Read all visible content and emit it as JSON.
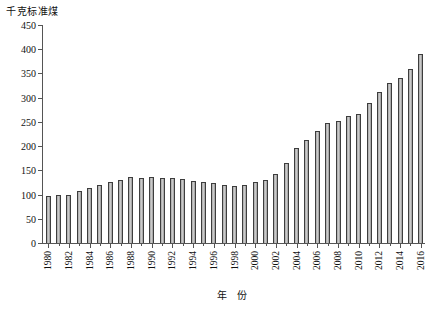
{
  "chart_data": {
    "type": "bar",
    "title": "",
    "ylabel": "千克标准煤",
    "xlabel": "年  份",
    "ylim": [
      0,
      450
    ],
    "ytick_step": 50,
    "yticks": [
      0,
      50,
      100,
      150,
      200,
      250,
      300,
      350,
      400,
      450
    ],
    "grid": false,
    "legend": null,
    "xtick_step": 2,
    "bar_color": "#b0b0b0",
    "bar_edge_color": "#3d3d3d",
    "categories": [
      "1980",
      "1981",
      "1982",
      "1983",
      "1984",
      "1985",
      "1986",
      "1987",
      "1988",
      "1989",
      "1990",
      "1991",
      "1992",
      "1993",
      "1994",
      "1995",
      "1996",
      "1997",
      "1998",
      "1999",
      "2000",
      "2001",
      "2002",
      "2003",
      "2004",
      "2005",
      "2006",
      "2007",
      "2008",
      "2009",
      "2010",
      "2011",
      "2012",
      "2013",
      "2014",
      "2015",
      "2016"
    ],
    "tick_labels": [
      "1980",
      "1982",
      "1984",
      "1986",
      "1988",
      "1990",
      "1992",
      "1994",
      "1996",
      "1998",
      "2000",
      "2002",
      "2004",
      "2006",
      "2008",
      "2010",
      "2012",
      "2014",
      "2016"
    ],
    "values": [
      97,
      99,
      100,
      107,
      113,
      120,
      126,
      130,
      136,
      135,
      137,
      135,
      134,
      133,
      127,
      125,
      123,
      120,
      118,
      119,
      125,
      130,
      143,
      165,
      196,
      213,
      232,
      248,
      252,
      262,
      267,
      289,
      312,
      330,
      340,
      360,
      390
    ],
    "ymax_label": "450",
    "ymin_label": "0"
  }
}
